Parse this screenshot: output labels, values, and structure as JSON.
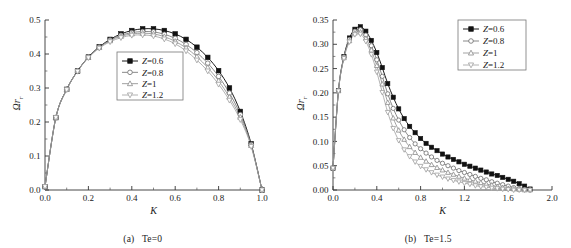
{
  "figure": {
    "panels": [
      {
        "caption_label": "(a)",
        "caption_text": "Te=0",
        "xlabel": "K",
        "ylabel": "Ω",
        "ylabel_sub": "r"
      },
      {
        "caption_label": "(b)",
        "caption_text": "Te=1.5",
        "xlabel": "K",
        "ylabel": "Ω",
        "ylabel_sub": "r"
      }
    ]
  },
  "chart_data": [
    {
      "type": "line",
      "title": "(a) Te=0",
      "xlabel": "K",
      "ylabel": "Ωr",
      "xlim": [
        0.0,
        1.0
      ],
      "ylim": [
        0.0,
        0.5
      ],
      "xticks": [
        "0.0",
        "0.2",
        "0.4",
        "0.6",
        "0.8",
        "1.0"
      ],
      "yticks": [
        "0.0",
        "0.1",
        "0.2",
        "0.3",
        "0.4",
        "0.5"
      ],
      "xtick_values": [
        0.0,
        0.2,
        0.4,
        0.6,
        0.8,
        1.0
      ],
      "ytick_values": [
        0.0,
        0.1,
        0.2,
        0.3,
        0.4,
        0.5
      ],
      "grid": false,
      "legend_position": "center",
      "x": [
        0.0,
        0.05,
        0.1,
        0.15,
        0.2,
        0.25,
        0.3,
        0.35,
        0.4,
        0.45,
        0.5,
        0.55,
        0.6,
        0.65,
        0.7,
        0.75,
        0.8,
        0.85,
        0.9,
        0.95,
        1.0
      ],
      "series": [
        {
          "name": "Z=0.6",
          "marker": "filled-square",
          "color": "#1a1a1a",
          "values": [
            0.01,
            0.213,
            0.296,
            0.35,
            0.391,
            0.421,
            0.443,
            0.459,
            0.469,
            0.474,
            0.474,
            0.469,
            0.459,
            0.443,
            0.42,
            0.39,
            0.351,
            0.3,
            0.231,
            0.136,
            0.0
          ]
        },
        {
          "name": "Z=0.8",
          "marker": "open-circle",
          "color": "#6b6b6b",
          "values": [
            0.01,
            0.213,
            0.296,
            0.35,
            0.391,
            0.42,
            0.441,
            0.455,
            0.463,
            0.466,
            0.465,
            0.458,
            0.446,
            0.428,
            0.404,
            0.373,
            0.334,
            0.285,
            0.222,
            0.134,
            0.0
          ]
        },
        {
          "name": "Z=1",
          "marker": "open-triangle-up",
          "color": "#8a8a8a",
          "values": [
            0.01,
            0.213,
            0.296,
            0.35,
            0.39,
            0.419,
            0.439,
            0.452,
            0.459,
            0.461,
            0.459,
            0.451,
            0.437,
            0.418,
            0.392,
            0.36,
            0.321,
            0.273,
            0.214,
            0.131,
            0.0
          ]
        },
        {
          "name": "Z=1.2",
          "marker": "open-triangle-down",
          "color": "#9e9e9e",
          "values": [
            0.01,
            0.213,
            0.295,
            0.349,
            0.389,
            0.417,
            0.436,
            0.448,
            0.455,
            0.456,
            0.453,
            0.444,
            0.43,
            0.409,
            0.382,
            0.35,
            0.311,
            0.264,
            0.207,
            0.128,
            0.0
          ]
        }
      ]
    },
    {
      "type": "line",
      "title": "(b) Te=1.5",
      "xlabel": "K",
      "ylabel": "Ωr",
      "xlim": [
        0.0,
        2.0
      ],
      "ylim": [
        0.0,
        0.35
      ],
      "xticks": [
        "0.0",
        "0.4",
        "0.8",
        "1.2",
        "1.6",
        "2.0"
      ],
      "yticks": [
        "0.00",
        "0.05",
        "0.10",
        "0.15",
        "0.20",
        "0.25",
        "0.30",
        "0.35"
      ],
      "xtick_values": [
        0.0,
        0.4,
        0.8,
        1.2,
        1.6,
        2.0
      ],
      "ytick_values": [
        0.0,
        0.05,
        0.1,
        0.15,
        0.2,
        0.25,
        0.3,
        0.35
      ],
      "grid": false,
      "legend_position": "upper right",
      "x": [
        0.0,
        0.05,
        0.1,
        0.15,
        0.2,
        0.25,
        0.3,
        0.35,
        0.4,
        0.45,
        0.5,
        0.55,
        0.6,
        0.65,
        0.7,
        0.75,
        0.8,
        0.85,
        0.9,
        0.95,
        1.0,
        1.05,
        1.1,
        1.15,
        1.2,
        1.25,
        1.3,
        1.35,
        1.4,
        1.45,
        1.5,
        1.55,
        1.6,
        1.65,
        1.7,
        1.75,
        1.8
      ],
      "series": [
        {
          "name": "Z=0.6",
          "marker": "filled-square",
          "color": "#1a1a1a",
          "values": [
            0.045,
            0.205,
            0.275,
            0.313,
            0.331,
            0.336,
            0.327,
            0.308,
            0.283,
            0.252,
            0.219,
            0.191,
            0.167,
            0.147,
            0.131,
            0.118,
            0.106,
            0.096,
            0.088,
            0.081,
            0.074,
            0.068,
            0.063,
            0.058,
            0.053,
            0.049,
            0.045,
            0.041,
            0.037,
            0.033,
            0.03,
            0.026,
            0.022,
            0.018,
            0.013,
            0.008,
            0.002
          ]
        },
        {
          "name": "Z=0.8",
          "marker": "open-circle",
          "color": "#6b6b6b",
          "values": [
            0.045,
            0.205,
            0.274,
            0.31,
            0.327,
            0.33,
            0.319,
            0.297,
            0.268,
            0.234,
            0.198,
            0.168,
            0.144,
            0.124,
            0.108,
            0.095,
            0.085,
            0.076,
            0.068,
            0.061,
            0.055,
            0.05,
            0.045,
            0.04,
            0.036,
            0.032,
            0.028,
            0.024,
            0.021,
            0.017,
            0.014,
            0.011,
            0.008,
            0.005,
            0.003,
            0.001,
            0.0
          ]
        },
        {
          "name": "Z=1",
          "marker": "open-triangle-up",
          "color": "#8a8a8a",
          "values": [
            0.045,
            0.204,
            0.272,
            0.307,
            0.323,
            0.325,
            0.312,
            0.288,
            0.256,
            0.218,
            0.18,
            0.148,
            0.123,
            0.104,
            0.089,
            0.077,
            0.067,
            0.059,
            0.052,
            0.046,
            0.041,
            0.036,
            0.032,
            0.028,
            0.024,
            0.021,
            0.018,
            0.015,
            0.012,
            0.01,
            0.007,
            0.005,
            0.003,
            0.002,
            0.001,
            0.0,
            0.0
          ]
        },
        {
          "name": "Z=1.2",
          "marker": "open-triangle-down",
          "color": "#9e9e9e",
          "values": [
            0.045,
            0.204,
            0.271,
            0.305,
            0.32,
            0.321,
            0.306,
            0.279,
            0.243,
            0.201,
            0.16,
            0.127,
            0.102,
            0.083,
            0.069,
            0.058,
            0.049,
            0.042,
            0.036,
            0.031,
            0.027,
            0.023,
            0.02,
            0.017,
            0.014,
            0.012,
            0.009,
            0.007,
            0.006,
            0.004,
            0.003,
            0.002,
            0.001,
            0.0,
            0.0,
            0.0,
            0.0
          ]
        }
      ]
    }
  ]
}
